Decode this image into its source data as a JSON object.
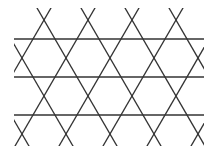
{
  "diagram": {
    "type": "kagome-lattice",
    "background": "#ffffff",
    "stroke_color": "#333333",
    "stroke_width": 1.3,
    "clip": {
      "x": 14,
      "y": 8,
      "width": 190,
      "height": 138
    },
    "horizontal_lines_y": [
      39,
      77,
      115
    ],
    "horizontal_x_range": [
      14,
      204
    ],
    "diagonal_spacing_x": 44,
    "row_height": 38,
    "top_crossings_x": [
      44,
      88,
      132,
      176
    ],
    "crossing_rows": [
      {
        "y": 20,
        "x": [
          44,
          88,
          132,
          176
        ]
      },
      {
        "y": 58,
        "x": [
          22,
          66,
          110,
          154,
          198
        ]
      },
      {
        "y": 96,
        "x": [
          44,
          88,
          132,
          176
        ]
      },
      {
        "y": 134,
        "x": [
          22,
          66,
          110,
          154,
          198
        ]
      }
    ]
  }
}
